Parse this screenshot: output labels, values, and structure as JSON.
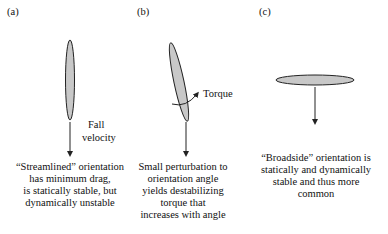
{
  "panels": [
    {
      "label": "(a)",
      "annotation_lines": [
        "Fall",
        "velocity"
      ],
      "caption_lines": [
        "“Streamlined” orientation",
        "has minimum drag,",
        "is statically stable, but",
        "dynamically unstable"
      ]
    },
    {
      "label": "(b)",
      "annotation_lines": [
        "Torque"
      ],
      "caption_lines": [
        "Small perturbation to",
        "orientation angle",
        "yields destabilizing",
        "torque that",
        "increases with angle"
      ]
    },
    {
      "label": "(c)",
      "annotation_lines": [],
      "caption_lines": [
        "“Broadside” orientation is",
        "statically and dynamically",
        "stable and thus more",
        "common"
      ]
    }
  ],
  "colors": {
    "body_fill": "#c8c8c8",
    "stroke": "#222222"
  }
}
